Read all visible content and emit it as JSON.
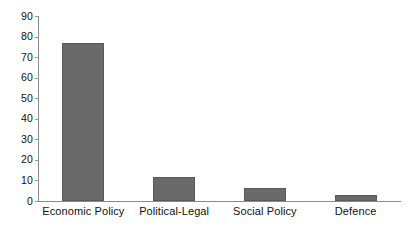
{
  "chart_data": {
    "type": "bar",
    "title": "",
    "subtitle": "",
    "xlabel": "",
    "ylabel": "",
    "categories": [
      "Economic Policy",
      "Political-Legal",
      "Social Policy",
      "Defence"
    ],
    "values": [
      77,
      11.5,
      6.5,
      3
    ],
    "series": [
      {
        "name": "",
        "values": [
          77,
          11.5,
          6.5,
          3
        ]
      }
    ],
    "ylim": [
      0,
      90
    ],
    "yticks": [
      0,
      10,
      20,
      30,
      40,
      50,
      60,
      70,
      80,
      90
    ],
    "ytick_labels": [
      "0",
      "10",
      "20",
      "30",
      "40",
      "50",
      "60",
      "70",
      "80",
      "90"
    ],
    "grid": false,
    "legend": false,
    "legend_position": "none",
    "annotations": [],
    "colors": {
      "bar_fill": "#6a6a6a",
      "bar_edge": "#5a5a5a",
      "axis": "#8a8a8a",
      "text": "#111111",
      "background": "#ffffff"
    }
  }
}
